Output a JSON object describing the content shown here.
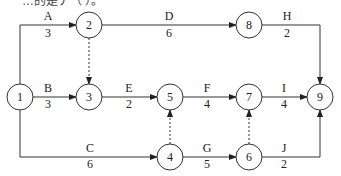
{
  "header": {
    "cropped_text": "…的是ア（ ）。"
  },
  "nodes": [
    {
      "id": "1",
      "x": 20,
      "y": 97
    },
    {
      "id": "2",
      "x": 89,
      "y": 25
    },
    {
      "id": "3",
      "x": 89,
      "y": 97
    },
    {
      "id": "4",
      "x": 170,
      "y": 157
    },
    {
      "id": "5",
      "x": 170,
      "y": 97
    },
    {
      "id": "6",
      "x": 249,
      "y": 157
    },
    {
      "id": "7",
      "x": 249,
      "y": 97
    },
    {
      "id": "8",
      "x": 249,
      "y": 25
    },
    {
      "id": "9",
      "x": 320,
      "y": 97
    }
  ],
  "activities": [
    {
      "name": "A",
      "duration": "3",
      "from": "1",
      "to": "2"
    },
    {
      "name": "B",
      "duration": "3",
      "from": "1",
      "to": "3"
    },
    {
      "name": "C",
      "duration": "6",
      "from": "1",
      "to": "4"
    },
    {
      "name": "D",
      "duration": "6",
      "from": "2",
      "to": "8"
    },
    {
      "name": "E",
      "duration": "2",
      "from": "3",
      "to": "5"
    },
    {
      "name": "F",
      "duration": "4",
      "from": "5",
      "to": "7"
    },
    {
      "name": "G",
      "duration": "5",
      "from": "4",
      "to": "6"
    },
    {
      "name": "H",
      "duration": "2",
      "from": "8",
      "to": "9"
    },
    {
      "name": "I",
      "duration": "4",
      "from": "7",
      "to": "9"
    },
    {
      "name": "J",
      "duration": "2",
      "from": "6",
      "to": "9"
    }
  ],
  "dummy_activities": [
    {
      "from": "2",
      "to": "3"
    },
    {
      "from": "4",
      "to": "5"
    },
    {
      "from": "6",
      "to": "7"
    }
  ]
}
